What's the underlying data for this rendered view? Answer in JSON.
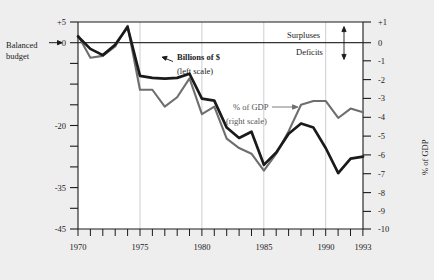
{
  "chart_data": {
    "type": "line",
    "title": "",
    "subtitle": "",
    "xlabel": "",
    "ylabel": "$Billions",
    "y2label": "% of GDP",
    "xlim": [
      1970,
      1993
    ],
    "ylim": [
      -45,
      5
    ],
    "y2lim": [
      -10,
      1
    ],
    "grid": "vertical gridlines at 1975, 1980, 1985, 1990",
    "legend_position": "inline annotations",
    "x": [
      1970,
      1971,
      1972,
      1973,
      1974,
      1975,
      1976,
      1977,
      1978,
      1979,
      1980,
      1981,
      1982,
      1983,
      1984,
      1985,
      1986,
      1987,
      1988,
      1989,
      1990,
      1991,
      1992,
      1993
    ],
    "xticks": [
      1970,
      1975,
      1980,
      1985,
      1990,
      1993
    ],
    "xticklabels": [
      "1970",
      "1975",
      "1980",
      "1985",
      "1990",
      "1993"
    ],
    "yticks_left": [
      5,
      0,
      -5,
      -10,
      -15,
      -20,
      -25,
      -30,
      -35,
      -40,
      -45
    ],
    "yticklabels_left": [
      "+5",
      "0",
      "",
      "",
      "",
      "-20",
      "",
      "",
      "-35",
      "",
      "-45"
    ],
    "yticks_right": [
      1,
      0,
      -1,
      -2,
      -3,
      -4,
      -5,
      -6,
      -7,
      -8,
      -9,
      -10
    ],
    "yticklabels_right": [
      "+1",
      "0",
      "-1",
      "-2",
      "-3",
      "-4",
      "-5",
      "-6",
      "-7",
      "-8",
      "-9",
      "-10"
    ],
    "series": [
      {
        "name": "Billions of $ (left scale)",
        "axis": "left",
        "color": "#1a1a1a",
        "width": 2.6,
        "values": [
          -2.8,
          -23.0,
          -23.4,
          -14.9,
          -6.1,
          -53.2,
          -73.7,
          -53.7,
          -59.2,
          -40.7,
          -73.8,
          -79.0,
          -128.0,
          -207.8,
          -185.4,
          -212.3,
          -221.2,
          -149.7,
          -155.2,
          -152.5,
          -221.2,
          -269.4,
          -290.4,
          -255.0
        ],
        "plot_values_left_scale": [
          1.5,
          -1.5,
          -3.0,
          -0.5,
          3.8,
          -8.0,
          -8.5,
          -8.7,
          -8.5,
          -7.5,
          -13.5,
          -14.0,
          -20.5,
          -23.0,
          -21.5,
          -29.5,
          -26.5,
          -22.0,
          -19.5,
          -20.5,
          -25.5,
          -31.5,
          -28.0,
          -27.5
        ]
      },
      {
        "name": "% of GDP (right scale)",
        "axis": "right",
        "color": "#6e6e6e",
        "width": 2.0,
        "values": [
          0.3,
          -2.1,
          -1.9,
          -1.1,
          -0.4,
          -3.3,
          -4.1,
          -2.6,
          -2.6,
          -1.6,
          -2.6,
          -2.5,
          -3.9,
          -5.9,
          -4.7,
          -5.0,
          -5.0,
          -3.2,
          -3.0,
          -2.8,
          -3.9,
          -4.5,
          -4.6,
          -3.9
        ],
        "plot_values_right_scale": [
          0.3,
          -0.9,
          -0.8,
          -0.3,
          0.8,
          -2.6,
          -2.6,
          -3.5,
          -3.0,
          -2.0,
          -3.9,
          -3.5,
          -5.2,
          -5.7,
          -6.0,
          -6.9,
          -6.0,
          -4.8,
          -3.4,
          -3.2,
          -3.2,
          -4.1,
          -3.6,
          -3.8
        ]
      }
    ],
    "annotations": [
      {
        "text": "Balanced budget",
        "at": "left of zero line, with arrow"
      },
      {
        "text": "Billions of $",
        "at": "pointer to black line"
      },
      {
        "text": "(left scale)",
        "at": "below Billions of $"
      },
      {
        "text": "% of GDP",
        "at": "pointer to gray line"
      },
      {
        "text": "(right scale)",
        "at": "below % of GDP"
      },
      {
        "text": "Surpluses",
        "at": "above zero line, right side"
      },
      {
        "text": "Deficits",
        "at": "below zero line, right side"
      }
    ]
  },
  "axes": {
    "left_title": "$Billions",
    "right_title": "% of GDP",
    "left_ticks": [
      {
        "value": 5,
        "label": "+5"
      },
      {
        "value": 0,
        "label": "0"
      },
      {
        "value": -5,
        "label": ""
      },
      {
        "value": -10,
        "label": ""
      },
      {
        "value": -15,
        "label": ""
      },
      {
        "value": -20,
        "label": "-20"
      },
      {
        "value": -25,
        "label": ""
      },
      {
        "value": -30,
        "label": ""
      },
      {
        "value": -35,
        "label": "-35"
      },
      {
        "value": -40,
        "label": ""
      },
      {
        "value": -45,
        "label": "-45"
      }
    ],
    "right_ticks": [
      {
        "value": 1,
        "label": "+1"
      },
      {
        "value": 0,
        "label": "0"
      },
      {
        "value": -1,
        "label": "-1"
      },
      {
        "value": -2,
        "label": "-2"
      },
      {
        "value": -3,
        "label": "-3"
      },
      {
        "value": -4,
        "label": "-4"
      },
      {
        "value": -5,
        "label": "-5"
      },
      {
        "value": -6,
        "label": "-6"
      },
      {
        "value": -7,
        "label": "-7"
      },
      {
        "value": -8,
        "label": "-8"
      },
      {
        "value": -9,
        "label": "-9"
      },
      {
        "value": -10,
        "label": "-10"
      }
    ],
    "x_labels": [
      "1970",
      "1975",
      "1980",
      "1985",
      "1990",
      "1993"
    ]
  },
  "annotations": {
    "balanced_budget_line1": "Balanced",
    "balanced_budget_line2": "budget",
    "billions_line1": "Billions of $",
    "billions_line2": "(left scale)",
    "gdp_line1": "% of GDP",
    "gdp_line2": "(right scale)",
    "surpluses": "Surpluses",
    "deficits": "Deficits"
  },
  "colors": {
    "background": "#eeeeee",
    "plot_background": "#ffffff",
    "black_line": "#1a1a1a",
    "gray_line": "#6e6e6e",
    "gridline": "#c8c8c8",
    "axis": "#1a1a1a",
    "text": "#1a1a1a",
    "gray_text": "#555555"
  }
}
